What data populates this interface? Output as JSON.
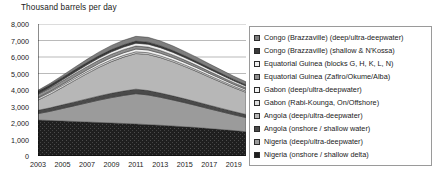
{
  "chart_data": {
    "type": "area",
    "stacked": true,
    "title": "Thousand barrels per day",
    "xlabel": "",
    "ylabel": "Thousand barrels per day",
    "ylim": [
      0,
      8000
    ],
    "ytick_labels": [
      "0",
      "1,000",
      "2,000",
      "3,000",
      "4,000",
      "5,000",
      "6,000",
      "7,000",
      "8,000"
    ],
    "yticks": [
      0,
      1000,
      2000,
      3000,
      4000,
      5000,
      6000,
      7000,
      8000
    ],
    "grid": true,
    "legend_position": "right",
    "x": [
      2003,
      2004,
      2005,
      2006,
      2007,
      2008,
      2009,
      2010,
      2011,
      2012,
      2013,
      2014,
      2015,
      2016,
      2017,
      2018,
      2019,
      2020
    ],
    "xtick_labels": [
      "2003",
      "2005",
      "2007",
      "2009",
      "2011",
      "2013",
      "2015",
      "2017",
      "2019"
    ],
    "xticks": [
      2003,
      2005,
      2007,
      2009,
      2011,
      2013,
      2015,
      2017,
      2019
    ],
    "series": [
      {
        "name": "Nigeria (onshore / shallow delta)",
        "color": "#1f1f1f",
        "pattern": "dense-speckle",
        "values": [
          2180,
          2150,
          2120,
          2090,
          2060,
          2030,
          2000,
          1970,
          1940,
          1900,
          1860,
          1820,
          1770,
          1720,
          1660,
          1600,
          1540,
          1470
        ]
      },
      {
        "name": "Nigeria (deep/ultra-deepwater)",
        "color": "#9b9b9b",
        "pattern": "solid",
        "values": [
          390,
          560,
          760,
          960,
          1160,
          1360,
          1540,
          1700,
          1840,
          1800,
          1700,
          1580,
          1460,
          1330,
          1200,
          1080,
          960,
          860
        ]
      },
      {
        "name": "Angola (onshore / shallow water)",
        "color": "#4a4a4a",
        "pattern": "solid",
        "values": [
          200,
          210,
          220,
          230,
          240,
          250,
          260,
          265,
          270,
          265,
          255,
          245,
          235,
          225,
          215,
          205,
          195,
          185
        ]
      },
      {
        "name": "Angola (deep/ultra-deepwater)",
        "color": "#b7b7b7",
        "pattern": "solid",
        "values": [
          620,
          830,
          1060,
          1300,
          1530,
          1740,
          1920,
          2060,
          2160,
          2190,
          2150,
          2070,
          1960,
          1840,
          1710,
          1580,
          1450,
          1340
        ]
      },
      {
        "name": "Gabon (Rabi-Kounga, On/Offshore)",
        "color": "#dcdcdc",
        "pattern": "solid",
        "values": [
          120,
          120,
          118,
          116,
          114,
          112,
          110,
          108,
          106,
          104,
          102,
          100,
          97,
          94,
          91,
          88,
          85,
          82
        ]
      },
      {
        "name": "Gabon (deep/ultra-deepwater)",
        "color": "#f2f2f2",
        "pattern": "solid",
        "values": [
          40,
          55,
          72,
          90,
          108,
          126,
          142,
          155,
          165,
          168,
          164,
          157,
          148,
          139,
          129,
          119,
          109,
          100
        ]
      },
      {
        "name": "Equatorial Guinea (Zafiro/Okume/Alba)",
        "color": "#8f8f8f",
        "pattern": "solid",
        "values": [
          190,
          195,
          198,
          200,
          200,
          198,
          194,
          188,
          182,
          174,
          165,
          156,
          146,
          136,
          126,
          116,
          107,
          98
        ]
      },
      {
        "name": "Equatorial Guinea (blocks G, H, K, L, N)",
        "color": "#efefef",
        "pattern": "solid",
        "values": [
          30,
          48,
          68,
          90,
          112,
          132,
          150,
          164,
          174,
          176,
          172,
          164,
          154,
          144,
          133,
          122,
          112,
          102
        ]
      },
      {
        "name": "Congo (Brazzaville) (shallow & N'Kossa)",
        "color": "#3a3a3a",
        "pattern": "solid",
        "values": [
          150,
          150,
          148,
          146,
          143,
          140,
          136,
          132,
          128,
          123,
          118,
          113,
          107,
          101,
          96,
          90,
          85,
          80
        ]
      },
      {
        "name": "Congo (Brazzaville) (deep/ultra-deepwater)",
        "color": "#7e7e7e",
        "pattern": "solid",
        "values": [
          60,
          88,
          120,
          155,
          190,
          222,
          250,
          272,
          288,
          292,
          286,
          274,
          259,
          243,
          226,
          210,
          194,
          180
        ]
      }
    ],
    "legend_entries": [
      {
        "label": "Congo (Brazzaville) (deep/ultra-deepwater)",
        "color": "#7e7e7e"
      },
      {
        "label": "Congo (Brazzaville) (shallow & N'Kossa)",
        "color": "#3a3a3a"
      },
      {
        "label": "Equatorial Guinea (blocks G, H, K, L, N)",
        "color": "#efefef"
      },
      {
        "label": "Equatorial Guinea (Zafiro/Okume/Alba)",
        "color": "#8f8f8f"
      },
      {
        "label": "Gabon (deep/ultra-deepwater)",
        "color": "#f2f2f2"
      },
      {
        "label": "Gabon (Rabi-Kounga, On/Offshore)",
        "color": "#dcdcdc"
      },
      {
        "label": "Angola (deep/ultra-deepwater)",
        "color": "#b7b7b7"
      },
      {
        "label": "Angola (onshore / shallow water)",
        "color": "#4a4a4a"
      },
      {
        "label": "Nigeria (deep/ultra-deepwater)",
        "color": "#9b9b9b"
      },
      {
        "label": "Nigeria (onshore / shallow delta)",
        "color": "#1f1f1f"
      }
    ]
  }
}
